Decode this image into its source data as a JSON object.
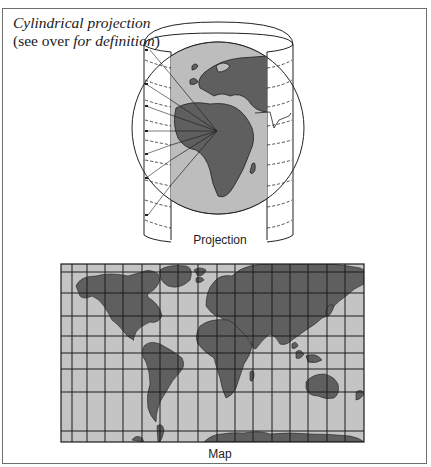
{
  "figure": {
    "title_line1": "Cylindrical projection",
    "title_line2_open": "(",
    "title_line2_upright": "see over ",
    "title_line2_italic": "for definition",
    "title_line2_close": ")"
  },
  "projection": {
    "caption": "Projection",
    "elements": [
      "cylinder",
      "globe",
      "projection-rays",
      "parallels-dashed"
    ]
  },
  "map": {
    "caption": "Map",
    "grid": "rectangular graticule (Mercator-style spacing)"
  },
  "colors": {
    "land": "#5f5f5f",
    "ocean": "#c8c8c8",
    "grid": "#222222",
    "frame": "#6e6e6e"
  }
}
